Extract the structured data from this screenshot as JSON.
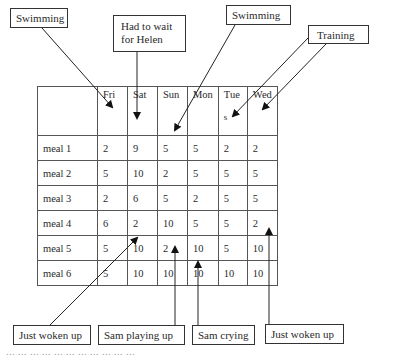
{
  "callouts_top": [
    {
      "id": "swimming-1",
      "label": "Swimming"
    },
    {
      "id": "wait-helen",
      "label": "Had to wait for Helen"
    },
    {
      "id": "swimming-2",
      "label": "Swimming"
    },
    {
      "id": "training",
      "label": "Training"
    }
  ],
  "callouts_bottom": [
    {
      "id": "just-woken-up-1",
      "label": "Just woken up"
    },
    {
      "id": "sam-playing-up",
      "label": "Sam playing up"
    },
    {
      "id": "sam-crying",
      "label": "Sam crying"
    },
    {
      "id": "just-woken-up-2",
      "label": "Just woken up"
    }
  ],
  "table": {
    "columns": [
      "",
      "Fri",
      "Sat",
      "Sun",
      "Mon",
      "Tue",
      "Wed"
    ],
    "tue_suffix": "s",
    "rows": [
      {
        "label": "meal 1",
        "values": [
          "2",
          "9",
          "5",
          "5",
          "2",
          "2"
        ]
      },
      {
        "label": "meal 2",
        "values": [
          "5",
          "10",
          "2",
          "5",
          "5",
          "5"
        ]
      },
      {
        "label": "meal 3",
        "values": [
          "2",
          "6",
          "5",
          "2",
          "5",
          "5"
        ]
      },
      {
        "label": "meal 4",
        "values": [
          "6",
          "2",
          "10",
          "5",
          "5",
          "2"
        ]
      },
      {
        "label": "meal 5",
        "values": [
          "5",
          "10",
          "2",
          "10",
          "5",
          "10"
        ]
      },
      {
        "label": "meal 6",
        "values": [
          "5",
          "10",
          "10",
          "10",
          "10",
          "10"
        ]
      }
    ]
  },
  "caption": "... ... ... ... ... ... ... ... ... ... ..."
}
